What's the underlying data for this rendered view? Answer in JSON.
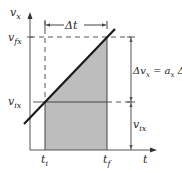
{
  "diagram": {
    "type": "velocity-time graph, constant acceleration",
    "axes": {
      "y_label": "v",
      "y_label_sub": "x",
      "x_label": "t"
    },
    "ticks": {
      "v_final": {
        "main": "v",
        "sub": "fx"
      },
      "v_initial": {
        "main": "v",
        "sub": "ix"
      },
      "t_initial": {
        "main": "t",
        "sub": "i"
      },
      "t_final": {
        "main": "t",
        "sub": "f"
      }
    },
    "annotations": {
      "delta_t": "Δt",
      "delta_v_lhs_prefix": "Δv",
      "delta_v_lhs_sub": "x",
      "equals": " = ",
      "delta_v_rhs_a": "a",
      "delta_v_rhs_a_sub": "x",
      "delta_v_rhs_dt": " Δt",
      "right_lower": {
        "main": "v",
        "sub": "ix"
      }
    },
    "colors": {
      "line": "#1a1a1a",
      "axis": "#555555",
      "shade": "#bdbdbd",
      "dashed": "#555555"
    }
  }
}
